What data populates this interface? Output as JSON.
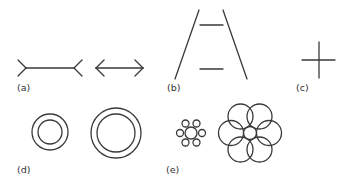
{
  "figure": {
    "panels": [
      {
        "id": "a",
        "label": "(a)",
        "name": "Müller-Lyer illusion",
        "elements": [
          "line with outward fins",
          "double-headed arrow"
        ]
      },
      {
        "id": "b",
        "label": "(b)",
        "name": "Ponzo illusion",
        "elements": [
          "converging lines",
          "upper bar",
          "lower bar"
        ]
      },
      {
        "id": "c",
        "label": "(c)",
        "name": "Vertical-horizontal illusion",
        "elements": [
          "horizontal line",
          "vertical line"
        ]
      },
      {
        "id": "d",
        "label": "(d)",
        "name": "Delboeuf illusion",
        "elements": [
          "small concentric rings",
          "large concentric rings"
        ]
      },
      {
        "id": "e",
        "label": "(e)",
        "name": "Ebbinghaus illusion",
        "elements": [
          "center circle with small surrounds",
          "center circle with large surrounds"
        ]
      }
    ],
    "stroke_color": "#3a3a3a",
    "background": "#ffffff"
  }
}
